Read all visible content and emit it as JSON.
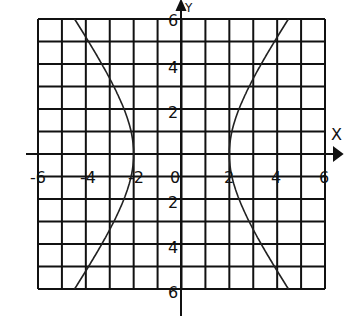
{
  "chart_data": {
    "type": "line",
    "title": "",
    "xlabel": "X",
    "ylabel": "Y",
    "xlim": [
      -6,
      6
    ],
    "ylim": [
      -6,
      6
    ],
    "grid": true,
    "grid_step": 1,
    "x_ticks": [
      "-6",
      "-4",
      "-2",
      "0",
      "2",
      "4",
      "6"
    ],
    "y_ticks": [
      "6",
      "4",
      "2",
      "2",
      "4",
      "6"
    ],
    "equation": "x^2/4 - y^2/9 = 1",
    "series": [
      {
        "name": "right branch",
        "points": [
          [
            4.47,
            -6
          ],
          [
            3.61,
            -4.5
          ],
          [
            2.83,
            -3
          ],
          [
            2.24,
            -1.5
          ],
          [
            2,
            0
          ],
          [
            2.24,
            1.5
          ],
          [
            2.83,
            3
          ],
          [
            3.61,
            4.5
          ],
          [
            4.47,
            6
          ]
        ]
      },
      {
        "name": "left branch",
        "points": [
          [
            -4.47,
            -6
          ],
          [
            -3.61,
            -4.5
          ],
          [
            -2.83,
            -3
          ],
          [
            -2.24,
            -1.5
          ],
          [
            -2,
            0
          ],
          [
            -2.24,
            1.5
          ],
          [
            -2.83,
            3
          ],
          [
            -3.61,
            4.5
          ],
          [
            -4.47,
            6
          ]
        ]
      }
    ]
  },
  "labels": {
    "x_axis": "X",
    "y_axis": "Y",
    "origin": "0",
    "xt_m6": "-6",
    "xt_m4": "-4",
    "xt_m2": "-2",
    "xt_2": "2",
    "xt_4": "4",
    "xt_6": "6",
    "yt_6": "6",
    "yt_4": "4",
    "yt_2": "2",
    "yt_m2": "2",
    "yt_m4": "4",
    "yt_m6": "6"
  }
}
